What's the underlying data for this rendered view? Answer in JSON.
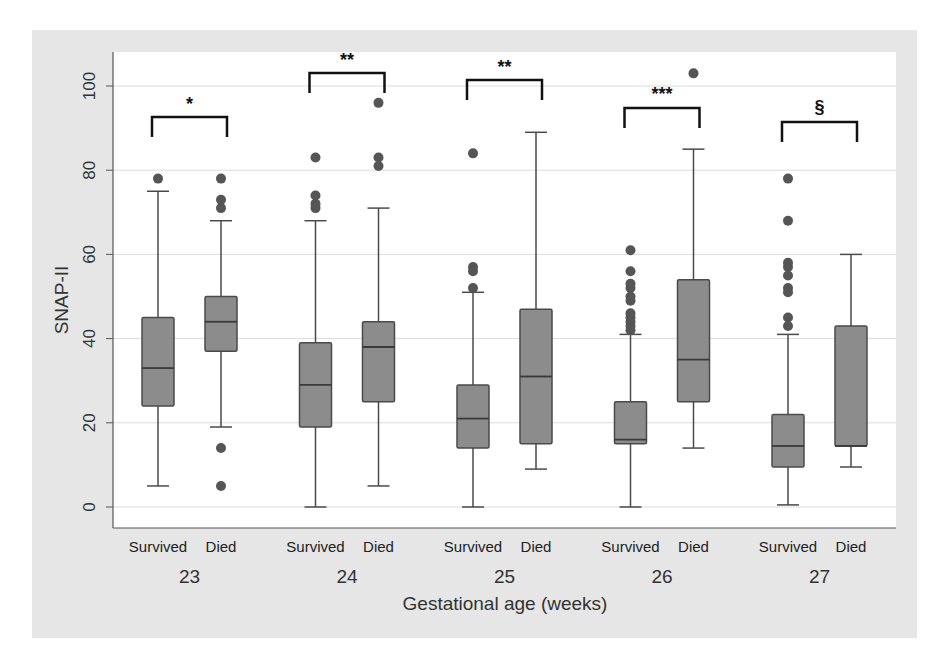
{
  "chart_data": {
    "type": "box",
    "title": "",
    "xlabel": "Gestational age (weeks)",
    "ylabel": "SNAP-II",
    "ylim": [
      0,
      105
    ],
    "yticks": [
      0,
      20,
      40,
      60,
      80,
      100
    ],
    "grid": true,
    "legend": null,
    "groups": [
      {
        "label": "23",
        "significance": "*",
        "boxes": [
          {
            "label": "Survived",
            "whisker_low": 5,
            "q1": 24,
            "median": 33,
            "q3": 45,
            "whisker_high": 75,
            "outliers": [
              78
            ]
          },
          {
            "label": "Died",
            "whisker_low": 19,
            "q1": 37,
            "median": 44,
            "q3": 50,
            "whisker_high": 68,
            "outliers": [
              78,
              73,
              71,
              14,
              5
            ]
          }
        ]
      },
      {
        "label": "24",
        "significance": "**",
        "boxes": [
          {
            "label": "Survived",
            "whisker_low": 0,
            "q1": 19,
            "median": 29,
            "q3": 39,
            "whisker_high": 68,
            "outliers": [
              83,
              74,
              72,
              71
            ]
          },
          {
            "label": "Died",
            "whisker_low": 5,
            "q1": 25,
            "median": 38,
            "q3": 44,
            "whisker_high": 71,
            "outliers": [
              96,
              83,
              81
            ]
          }
        ]
      },
      {
        "label": "25",
        "significance": "**",
        "boxes": [
          {
            "label": "Survived",
            "whisker_low": 0,
            "q1": 14,
            "median": 21,
            "q3": 29,
            "whisker_high": 51,
            "outliers": [
              84,
              57,
              56,
              52
            ]
          },
          {
            "label": "Died",
            "whisker_low": 9,
            "q1": 15,
            "median": 31,
            "q3": 47,
            "whisker_high": 89,
            "outliers": []
          }
        ]
      },
      {
        "label": "26",
        "significance": "***",
        "boxes": [
          {
            "label": "Survived",
            "whisker_low": 0,
            "q1": 15,
            "median": 16,
            "q3": 25,
            "whisker_high": 41,
            "outliers": [
              61,
              56,
              53,
              52,
              50,
              49,
              46,
              45,
              44,
              43,
              42
            ]
          },
          {
            "label": "Died",
            "whisker_low": 14,
            "q1": 25,
            "median": 35,
            "q3": 54,
            "whisker_high": 85,
            "outliers": [
              103
            ]
          }
        ]
      },
      {
        "label": "27",
        "significance": "§",
        "boxes": [
          {
            "label": "Survived",
            "whisker_low": 0.5,
            "q1": 9.5,
            "median": 14.5,
            "q3": 22,
            "whisker_high": 41,
            "outliers": [
              78,
              68,
              58,
              57,
              55,
              52,
              51,
              45,
              43
            ]
          },
          {
            "label": "Died",
            "whisker_low": 9.5,
            "q1": 14.5,
            "median": 14.5,
            "q3": 43,
            "whisker_high": 60,
            "outliers": []
          }
        ]
      }
    ]
  },
  "colors": {
    "frame_bg": "#e6e6e6",
    "plot_bg": "#ffffff",
    "box_fill": "#8c8c8c",
    "box_stroke": "#4a4a4a",
    "outlier": "#555555",
    "grid": "#dcdcdc",
    "axis": "#555555",
    "bracket": "#111111"
  },
  "layout": {
    "bracket_y": [
      117,
      73,
      80,
      108,
      122
    ],
    "sig_y": [
      110,
      66,
      73,
      100,
      113
    ]
  }
}
